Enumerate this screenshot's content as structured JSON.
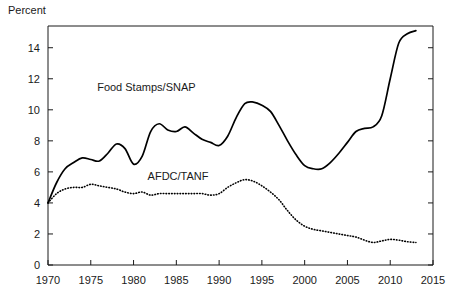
{
  "chart_data": {
    "type": "line",
    "title": "",
    "xlabel": "",
    "ylabel": "Percent",
    "xlim": [
      1970,
      2015
    ],
    "ylim": [
      0,
      15.4
    ],
    "grid": false,
    "legend": "inline-annotations",
    "xticks": [
      "1970",
      "1975",
      "1980",
      "1985",
      "1990",
      "1995",
      "2000",
      "2005",
      "2010",
      "2015"
    ],
    "xtick_values": [
      1970,
      1975,
      1980,
      1985,
      1990,
      1995,
      2000,
      2005,
      2010,
      2015
    ],
    "yticks": [
      "0",
      "2",
      "4",
      "6",
      "8",
      "10",
      "12",
      "14"
    ],
    "ytick_values": [
      0,
      2,
      4,
      6,
      8,
      10,
      12,
      14
    ],
    "series": [
      {
        "name": "Food Stamps/SNAP",
        "style": "solid",
        "color": "#000000",
        "label_x": 1981.5,
        "label_y": 11.2,
        "x": [
          1970,
          1971,
          1972,
          1973,
          1974,
          1975,
          1976,
          1977,
          1978,
          1979,
          1980,
          1981,
          1982,
          1983,
          1984,
          1985,
          1986,
          1987,
          1988,
          1989,
          1990,
          1991,
          1992,
          1993,
          1994,
          1995,
          1996,
          1997,
          1998,
          1999,
          2000,
          2001,
          2002,
          2003,
          2004,
          2005,
          2006,
          2007,
          2008,
          2009,
          2010,
          2011,
          2012,
          2013
        ],
        "y": [
          4.0,
          5.3,
          6.2,
          6.6,
          6.9,
          6.8,
          6.7,
          7.2,
          7.8,
          7.5,
          6.5,
          7.0,
          8.6,
          9.1,
          8.7,
          8.6,
          8.9,
          8.5,
          8.1,
          7.9,
          7.7,
          8.3,
          9.5,
          10.4,
          10.5,
          10.3,
          9.9,
          9.0,
          8.0,
          7.1,
          6.4,
          6.2,
          6.2,
          6.6,
          7.2,
          7.9,
          8.6,
          8.8,
          8.9,
          9.6,
          12.0,
          14.3,
          14.9,
          15.1
        ]
      },
      {
        "name": "AFDC/TANF",
        "style": "dotted",
        "color": "#000000",
        "label_x": 1985.2,
        "label_y": 5.5,
        "x": [
          1970,
          1971,
          1972,
          1973,
          1974,
          1975,
          1976,
          1977,
          1978,
          1979,
          1980,
          1981,
          1982,
          1983,
          1984,
          1985,
          1986,
          1987,
          1988,
          1989,
          1990,
          1991,
          1992,
          1993,
          1994,
          1995,
          1996,
          1997,
          1998,
          1999,
          2000,
          2001,
          2002,
          2003,
          2004,
          2005,
          2006,
          2007,
          2008,
          2009,
          2010,
          2011,
          2012,
          2013
        ],
        "y": [
          4.0,
          4.6,
          4.9,
          5.0,
          5.0,
          5.2,
          5.1,
          5.0,
          4.9,
          4.7,
          4.6,
          4.7,
          4.5,
          4.6,
          4.6,
          4.6,
          4.6,
          4.6,
          4.6,
          4.5,
          4.6,
          5.0,
          5.3,
          5.5,
          5.4,
          5.1,
          4.7,
          4.2,
          3.5,
          2.9,
          2.5,
          2.3,
          2.2,
          2.1,
          2.0,
          1.9,
          1.8,
          1.6,
          1.45,
          1.55,
          1.65,
          1.6,
          1.5,
          1.45
        ]
      }
    ]
  },
  "labels": {
    "y_axis_title": "Percent"
  }
}
